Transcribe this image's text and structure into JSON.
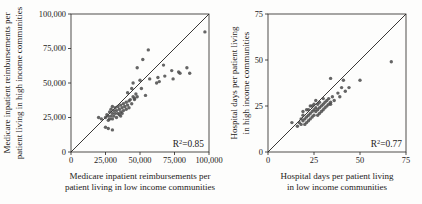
{
  "figure": {
    "background": "#fdfdfc",
    "ink_color": "#242120",
    "dot_color": "#4a4a4a"
  },
  "chart_data": [
    {
      "type": "scatter",
      "title": "",
      "xlabel_lines": [
        "Medicare inpatient reimbursements per",
        "patient living in low income communities"
      ],
      "ylabel_lines": [
        "Medicare inpatient reimbursements per",
        "patient living in high income communities"
      ],
      "xlim": [
        0,
        100000
      ],
      "ylim": [
        0,
        100000
      ],
      "xticks": [
        0,
        25000,
        50000,
        75000,
        100000
      ],
      "yticks": [
        0,
        25000,
        50000,
        75000,
        100000
      ],
      "xtick_labels": [
        "0",
        "25,000",
        "50,000",
        "75,000",
        "100,000"
      ],
      "ytick_labels": [
        "0",
        "25,000",
        "50,000",
        "75,000",
        "100,000"
      ],
      "grid": "off",
      "legend": "none",
      "identity_line": true,
      "r_squared": {
        "base": "R",
        "sup": "2",
        "rest": "=0.85"
      },
      "points": [
        [
          25000,
          25000
        ],
        [
          26000,
          27000
        ],
        [
          27000,
          23000
        ],
        [
          27000,
          26000
        ],
        [
          28000,
          29000
        ],
        [
          28000,
          24000
        ],
        [
          29000,
          26000
        ],
        [
          29000,
          31000
        ],
        [
          30000,
          28000
        ],
        [
          30000,
          24000
        ],
        [
          31000,
          30000
        ],
        [
          31000,
          26000
        ],
        [
          32000,
          32000
        ],
        [
          32000,
          28000
        ],
        [
          33000,
          25000
        ],
        [
          33000,
          30000
        ],
        [
          34000,
          33000
        ],
        [
          34000,
          28000
        ],
        [
          35000,
          31000
        ],
        [
          35000,
          27000
        ],
        [
          36000,
          34000
        ],
        [
          36000,
          29000
        ],
        [
          37000,
          32000
        ],
        [
          37000,
          28000
        ],
        [
          38000,
          35000
        ],
        [
          38000,
          30000
        ],
        [
          39000,
          33000
        ],
        [
          40000,
          36000
        ],
        [
          40000,
          31000
        ],
        [
          41000,
          34000
        ],
        [
          42000,
          37000
        ],
        [
          42000,
          32000
        ],
        [
          43000,
          38000
        ],
        [
          44000,
          35000
        ],
        [
          45000,
          40000
        ],
        [
          46000,
          38000
        ],
        [
          47000,
          42000
        ],
        [
          48000,
          40000
        ],
        [
          36000,
          26000
        ],
        [
          30000,
          33000
        ],
        [
          20000,
          25000
        ],
        [
          22000,
          24000
        ],
        [
          25000,
          18000
        ],
        [
          27000,
          17000
        ],
        [
          30000,
          16000
        ],
        [
          44000,
          46000
        ],
        [
          51000,
          46000
        ],
        [
          41000,
          43000
        ],
        [
          54000,
          41000
        ],
        [
          46000,
          39000
        ],
        [
          45000,
          50000
        ],
        [
          50000,
          52000
        ],
        [
          57000,
          53000
        ],
        [
          63000,
          54000
        ],
        [
          68000,
          55000
        ],
        [
          73000,
          59000
        ],
        [
          78000,
          58000
        ],
        [
          67000,
          63000
        ],
        [
          52000,
          67000
        ],
        [
          56000,
          74000
        ],
        [
          48000,
          61000
        ],
        [
          62000,
          50000
        ],
        [
          64000,
          51000
        ],
        [
          74000,
          53000
        ],
        [
          79000,
          57000
        ],
        [
          84000,
          61000
        ],
        [
          86000,
          57000
        ],
        [
          97000,
          87000
        ]
      ]
    },
    {
      "type": "scatter",
      "title": "",
      "xlabel_lines": [
        "Hospital days per patient living",
        "in low income communities"
      ],
      "ylabel_lines": [
        "Hospital days per patient living",
        "in high income communities"
      ],
      "xlim": [
        0,
        75
      ],
      "ylim": [
        0,
        75
      ],
      "xticks": [
        0,
        25,
        50,
        75
      ],
      "yticks": [
        0,
        25,
        50,
        75
      ],
      "xtick_labels": [
        "0",
        "25",
        "50",
        "75"
      ],
      "ytick_labels": [
        "0",
        "25",
        "50",
        "75"
      ],
      "grid": "off",
      "legend": "none",
      "identity_line": true,
      "r_squared": {
        "base": "R",
        "sup": "2",
        "rest": "=0.77"
      },
      "points": [
        [
          17,
          16
        ],
        [
          18,
          18
        ],
        [
          18,
          15
        ],
        [
          19,
          17
        ],
        [
          19,
          20
        ],
        [
          20,
          18
        ],
        [
          20,
          15
        ],
        [
          21,
          19
        ],
        [
          21,
          16
        ],
        [
          22,
          20
        ],
        [
          22,
          17
        ],
        [
          22,
          23
        ],
        [
          23,
          21
        ],
        [
          23,
          18
        ],
        [
          24,
          22
        ],
        [
          24,
          19
        ],
        [
          25,
          23
        ],
        [
          25,
          20
        ],
        [
          25,
          26
        ],
        [
          26,
          22
        ],
        [
          26,
          24
        ],
        [
          27,
          23
        ],
        [
          27,
          20
        ],
        [
          27,
          26
        ],
        [
          28,
          24
        ],
        [
          28,
          21
        ],
        [
          29,
          25
        ],
        [
          29,
          22
        ],
        [
          30,
          26
        ],
        [
          30,
          23
        ],
        [
          31,
          27
        ],
        [
          31,
          24
        ],
        [
          32,
          25
        ],
        [
          32,
          28
        ],
        [
          33,
          26
        ],
        [
          33,
          29
        ],
        [
          34,
          27
        ],
        [
          35,
          30
        ],
        [
          23,
          25
        ],
        [
          21,
          23
        ],
        [
          19,
          22
        ],
        [
          26,
          28
        ],
        [
          28,
          27
        ],
        [
          30,
          29
        ],
        [
          24,
          25
        ],
        [
          16,
          14
        ],
        [
          13,
          16
        ],
        [
          34,
          40
        ],
        [
          41,
          39
        ],
        [
          50,
          39
        ],
        [
          44,
          35
        ],
        [
          40,
          35
        ],
        [
          42,
          33
        ],
        [
          38,
          32
        ],
        [
          39,
          30
        ],
        [
          36,
          28
        ],
        [
          34,
          26
        ],
        [
          67,
          49
        ]
      ]
    }
  ]
}
